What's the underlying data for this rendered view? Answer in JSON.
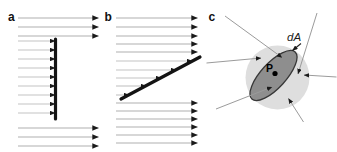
{
  "colors": {
    "background": "#ffffff",
    "field_line_gray": "#b0b0b0",
    "terminating_line_gray": "#c3c3c3",
    "arrowhead_dark": "#1a1a1a",
    "surface_black": "#141414",
    "region_circle_fill": "#dedede",
    "area_ellipse_fill": "#8e8e8e",
    "area_ellipse_stroke": "#383838",
    "ray_gray": "#9b9b9b",
    "label_color": "#111111"
  },
  "panel_a": {
    "label": "a",
    "x_start": 18,
    "x_tip": 98.5,
    "full_arrows_y": [
      18,
      27,
      36,
      128,
      137,
      146
    ],
    "short_arrows_y": [
      41,
      50,
      59,
      68,
      77,
      86,
      95,
      104,
      113
    ],
    "short_tip_x": 55,
    "surface": {
      "x": 55.5,
      "y1": 39,
      "y2": 119
    }
  },
  "panel_b": {
    "label": "b",
    "x_start": 116,
    "x_tip": 197.5,
    "full_arrows_y": [
      18,
      27,
      36,
      44,
      52,
      103,
      111,
      119,
      127,
      135,
      143
    ],
    "short_arrows": [
      {
        "y": 61,
        "tip_x": 192
      },
      {
        "y": 70,
        "tip_x": 176
      },
      {
        "y": 78,
        "tip_x": 161
      },
      {
        "y": 86,
        "tip_x": 146
      },
      {
        "y": 95,
        "tip_x": 129
      }
    ],
    "surface": {
      "x1": 121,
      "y1": 99,
      "x2": 200,
      "y2": 57
    }
  },
  "panel_c": {
    "label": "c",
    "region_circle": {
      "cx": 277.5,
      "cy": 77.5,
      "r": 32
    },
    "area_ellipse": {
      "cx": 273.5,
      "cy": 75.5,
      "rx": 32,
      "ry": 12.5,
      "rotation_deg": -47.5
    },
    "point": {
      "label": "P",
      "dot_x": 275,
      "dot_y": 73.5,
      "dot_r": 2.6
    },
    "area_label": {
      "text": "dA"
    },
    "label_arrow": {
      "x1": 301,
      "y1": 43.5,
      "x2": 292.5,
      "y2": 50.5
    },
    "rays": [
      {
        "x1": 225,
        "y1": 16,
        "x2": 282,
        "y2": 57.5
      },
      {
        "x1": 206.5,
        "y1": 63,
        "x2": 261,
        "y2": 58
      },
      {
        "x1": 216,
        "y1": 109,
        "x2": 272,
        "y2": 87
      },
      {
        "x1": 317,
        "y1": 13,
        "x2": 298,
        "y2": 74
      },
      {
        "x1": 336.5,
        "y1": 77,
        "x2": 304,
        "y2": 75
      },
      {
        "x1": 303.5,
        "y1": 122,
        "x2": 288.5,
        "y2": 98.5
      }
    ]
  }
}
